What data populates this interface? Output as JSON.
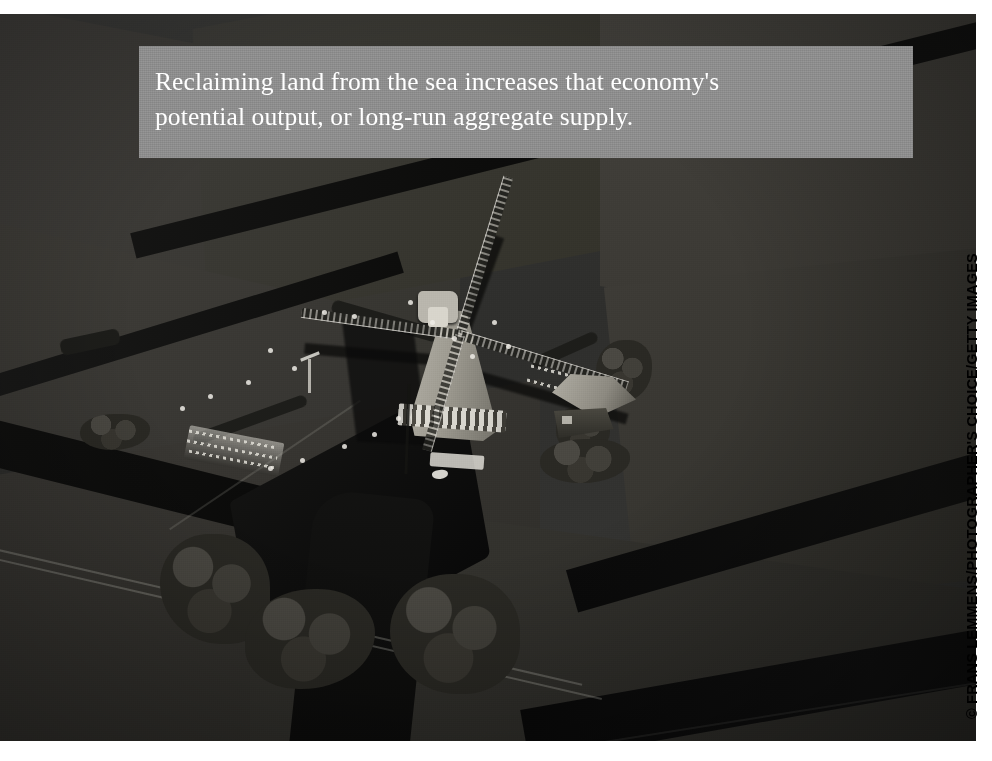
{
  "page": {
    "background_color": "#ffffff",
    "width": 992,
    "height": 761
  },
  "caption": {
    "line1": "Reclaiming land from the sea increases that economy's",
    "line2": "potential output, or long-run aggregate supply.",
    "full_text": "Reclaiming land from the sea increases that economy's potential output, or long-run aggregate supply.",
    "background_color": "#8f8f8f",
    "text_color": "#ffffff"
  },
  "photo": {
    "alt": "Aerial black-and-white photograph of a Dutch windmill on reclaimed polder land, surrounded by drainage canals and rectangular fields",
    "subject": "dutch-windmill-polder-aerial",
    "tone": "black-and-white",
    "elements": [
      "windmill-with-four-lattice-sails",
      "thatched-conical-mill-body",
      "farmhouse-with-gabled-roof",
      "tree-clusters",
      "drainage-canals",
      "wooden-footbridge",
      "fences",
      "field-tracks",
      "jetty-and-boat",
      "weather-vane"
    ],
    "colors": {
      "field_dark": "#2e2e2c",
      "field_light": "#44423d",
      "canal": "#0d0d0c",
      "mill_highlight": "#b9b6ad"
    }
  },
  "credit": {
    "text": "© FRANS LEMMENS/PHOTOGRAPHER'S CHOICE/GETTY IMAGES",
    "color": "#000000"
  },
  "livestock_markers": [
    {
      "x": 322,
      "y": 296
    },
    {
      "x": 352,
      "y": 300
    },
    {
      "x": 268,
      "y": 334
    },
    {
      "x": 292,
      "y": 352
    },
    {
      "x": 246,
      "y": 366
    },
    {
      "x": 208,
      "y": 380
    },
    {
      "x": 180,
      "y": 392
    },
    {
      "x": 408,
      "y": 286
    },
    {
      "x": 430,
      "y": 306
    },
    {
      "x": 452,
      "y": 322
    },
    {
      "x": 470,
      "y": 340
    },
    {
      "x": 492,
      "y": 306
    },
    {
      "x": 506,
      "y": 330
    },
    {
      "x": 396,
      "y": 402
    },
    {
      "x": 372,
      "y": 418
    },
    {
      "x": 342,
      "y": 430
    },
    {
      "x": 300,
      "y": 444
    },
    {
      "x": 268,
      "y": 452
    }
  ]
}
